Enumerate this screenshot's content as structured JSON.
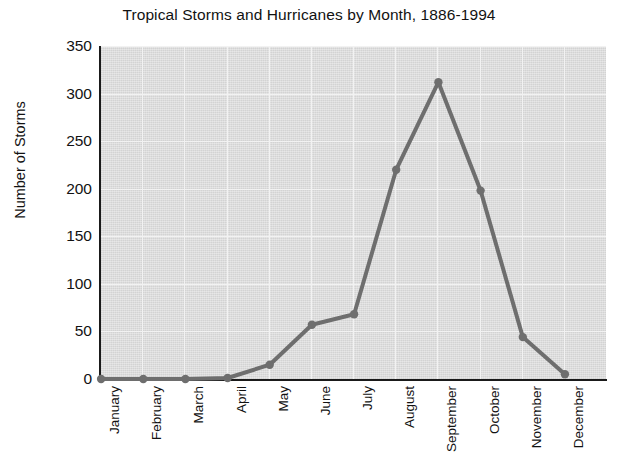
{
  "chart_data": {
    "type": "line",
    "title": "Tropical Storms and Hurricanes by Month, 1886-1994",
    "xlabel": "",
    "ylabel": "Number of Storms",
    "categories": [
      "January",
      "February",
      "March",
      "April",
      "May",
      "June",
      "July",
      "August",
      "September",
      "October",
      "November",
      "December"
    ],
    "values": [
      0,
      0,
      0,
      1,
      15,
      57,
      68,
      220,
      312,
      198,
      44,
      5
    ],
    "series": [
      {
        "name": "Number of Storms",
        "values": [
          0,
          0,
          0,
          1,
          15,
          57,
          68,
          220,
          312,
          198,
          44,
          5
        ]
      }
    ],
    "ylim": [
      0,
      350
    ],
    "yticks": [
      0,
      50,
      100,
      150,
      200,
      250,
      300,
      350
    ],
    "ytick_labels": [
      "0",
      "50",
      "100",
      "150",
      "200",
      "250",
      "300",
      "350"
    ],
    "grid": true,
    "legend": "none",
    "marker": "circle",
    "line_color": "#6e6e6e",
    "marker_color": "#6e6e6e",
    "plot_background": "#d3d3d3",
    "grid_color": "#f2f2f2",
    "axis_color": "#1a1a1a",
    "text_color": "#121212"
  }
}
